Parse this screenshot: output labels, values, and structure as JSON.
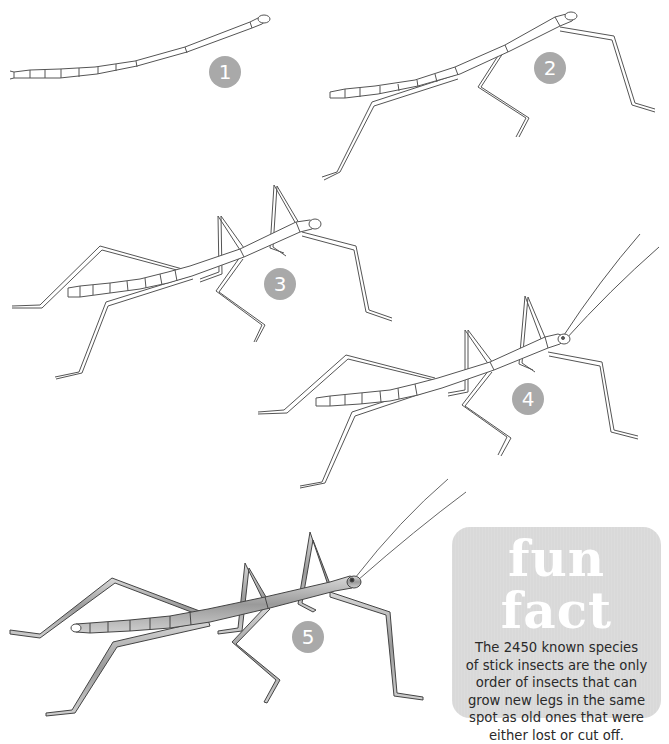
{
  "figure": {
    "stages": [
      {
        "number": "1",
        "label": "Stage 1 - body with no legs"
      },
      {
        "number": "2",
        "label": "Stage 2 - legs beginning to grow"
      },
      {
        "number": "3",
        "label": "Stage 3 - longer legs"
      },
      {
        "number": "4",
        "label": "Stage 4 - antennae appear"
      },
      {
        "number": "5",
        "label": "Stage 5 - fully grown, shaded"
      }
    ]
  },
  "fun_fact": {
    "title": "fun fact",
    "lines": [
      "The 2450 known species",
      "of stick insects are the only",
      "order of insects that can",
      "grow new legs in the same",
      "spot as old ones that were",
      "either lost or cut off."
    ]
  },
  "colors": {
    "badge": "#a9a9a9",
    "fact_box": "#d9d9d9",
    "line": "#4a4a4a"
  }
}
